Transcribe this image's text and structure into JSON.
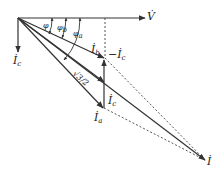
{
  "diagram": {
    "type": "phasor-diagram",
    "colors": {
      "line": "#333333",
      "dashed": "#555555",
      "background": "#ffffff"
    },
    "labels": {
      "V": {
        "base": "V̇",
        "sub": ""
      },
      "Ic": {
        "base": "İ",
        "sub": "c"
      },
      "Ib": {
        "base": "İ",
        "sub": "b"
      },
      "minusIc": {
        "base": "−İ",
        "sub": "c"
      },
      "Ic2": {
        "base": "İ",
        "sub": "c"
      },
      "Ia": {
        "base": "İ",
        "sub": "a"
      },
      "I": {
        "base": "İ",
        "sub": ""
      },
      "phi": {
        "base": "φ",
        "sub": ""
      },
      "phib": {
        "base": "φ",
        "sub": "b"
      },
      "phia": {
        "base": "φ",
        "sub": "a"
      },
      "fraction": {
        "text": "√3/2"
      }
    }
  }
}
